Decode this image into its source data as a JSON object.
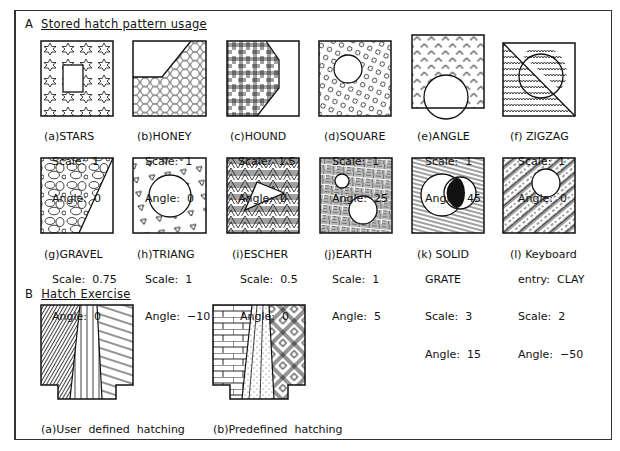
{
  "section_a": {
    "letter": "A",
    "title": "Stored hatch pattern usage"
  },
  "section_b": {
    "letter": "B",
    "title": "Hatch Exercise"
  },
  "patterns": [
    {
      "id": "a",
      "prefix": "(a)",
      "name": "STARS",
      "extra": "",
      "scale": "Scale:  1",
      "angle": "Angle:  0"
    },
    {
      "id": "b",
      "prefix": "(b)",
      "name": "HONEY",
      "extra": "",
      "scale": "Scale:  1",
      "angle": "Angle:  0"
    },
    {
      "id": "c",
      "prefix": "(c)",
      "name": "HOUND",
      "extra": "",
      "scale": "Scale:  1.5",
      "angle": "Angle:  0"
    },
    {
      "id": "d",
      "prefix": "(d)",
      "name": "SQUARE",
      "extra": "",
      "scale": "Scale:  1",
      "angle": "Angle:  25"
    },
    {
      "id": "e",
      "prefix": "(e)",
      "name": "ANGLE",
      "extra": "",
      "scale": "Scale:  1",
      "angle": "Angle:  45"
    },
    {
      "id": "f",
      "prefix": "(f)",
      "name": "ZIGZAG",
      "extra": "",
      "scale": "Scale:  1",
      "angle": "Angle:  0"
    },
    {
      "id": "g",
      "prefix": "(g)",
      "name": "GRAVEL",
      "extra": "",
      "scale": "Scale:  0.75",
      "angle": "Angle:  0"
    },
    {
      "id": "h",
      "prefix": "(h)",
      "name": "TRIANG",
      "extra": "",
      "scale": "Scale:  1",
      "angle": "Angle:  −10"
    },
    {
      "id": "i",
      "prefix": "(i)",
      "name": "ESCHER",
      "extra": "",
      "scale": "Scale:  0.5",
      "angle": "Angle:  0"
    },
    {
      "id": "j",
      "prefix": "(j)",
      "name": "EARTH",
      "extra": "",
      "scale": "Scale:  1",
      "angle": "Angle:  5"
    },
    {
      "id": "k",
      "prefix": "(k)",
      "name": "SOLID",
      "extra": "GRATE",
      "scale": "Scale:  3",
      "angle": "Angle:  15"
    },
    {
      "id": "l",
      "prefix": "(l)",
      "name": "Keyboard",
      "extra": "entry:  CLAY",
      "scale": "Scale:  2",
      "angle": "Angle:  −50"
    }
  ],
  "exercise": [
    {
      "id": "a",
      "caption": "(a)User  defined  hatching"
    },
    {
      "id": "b",
      "caption": "(b)Predefined  hatching"
    }
  ]
}
